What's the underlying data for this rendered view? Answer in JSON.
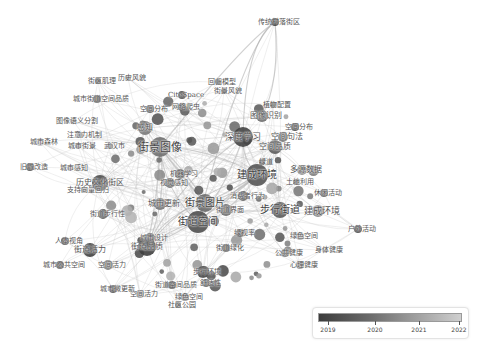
{
  "diagram": {
    "type": "keyword co-occurrence network overlay map",
    "nodes": [
      {
        "label": "街景图像",
        "x": 160,
        "y": 147,
        "r": 10,
        "shade": "#6f6f6f",
        "fs": 11
      },
      {
        "label": "街景图片",
        "x": 205,
        "y": 203,
        "r": 9,
        "shade": "#6a6a6a",
        "fs": 10
      },
      {
        "label": "街道空间",
        "x": 198,
        "y": 222,
        "r": 11,
        "shade": "#4f4f4f",
        "fs": 10
      },
      {
        "label": "建成环境",
        "x": 257,
        "y": 175,
        "r": 11,
        "shade": "#555555",
        "fs": 10
      },
      {
        "label": "步行街道",
        "x": 280,
        "y": 210,
        "r": 8,
        "shade": "#5a5a5a",
        "fs": 10
      },
      {
        "label": "城市更新",
        "x": 160,
        "y": 204,
        "r": 6,
        "shade": "#777777",
        "fs": 8
      },
      {
        "label": "历史文化街区",
        "x": 100,
        "y": 183,
        "r": 8,
        "shade": "#4b4b4b",
        "fs": 8
      },
      {
        "label": "深度学习",
        "x": 243,
        "y": 137,
        "r": 10,
        "shade": "#444444",
        "fs": 9
      },
      {
        "label": "空间品质",
        "x": 275,
        "y": 147,
        "r": 7,
        "shade": "#5c5c5c",
        "fs": 8
      },
      {
        "label": "图像识别",
        "x": 262,
        "y": 116,
        "r": 6,
        "shade": "#6a6a6a",
        "fs": 8
      },
      {
        "label": "空间句法",
        "x": 283,
        "y": 137,
        "r": 5,
        "shade": "#707070",
        "fs": 8
      },
      {
        "label": "多源数据",
        "x": 302,
        "y": 170,
        "r": 5,
        "shade": "#8c8c8c",
        "fs": 8
      },
      {
        "label": "街道品质",
        "x": 147,
        "y": 247,
        "r": 9,
        "shade": "#3f3f3f",
        "fs": 8
      },
      {
        "label": "感知",
        "x": 145,
        "y": 128,
        "r": 7,
        "shade": "#7a7a7a",
        "fs": 8
      },
      {
        "label": "建成环境",
        "x": 318,
        "y": 211,
        "r": 6,
        "shade": "#858585",
        "fs": 9
      },
      {
        "label": "传统村落街区",
        "x": 275,
        "y": 22,
        "r": 4,
        "shade": "#2f2f2f",
        "fs": 7
      },
      {
        "label": "历史风貌",
        "x": 128,
        "y": 78,
        "r": 3,
        "shade": "#909090",
        "fs": 7
      },
      {
        "label": "街区肌理",
        "x": 98,
        "y": 81,
        "r": 3,
        "shade": "#3b3b3b",
        "fs": 7
      },
      {
        "label": "城市街道空间品质",
        "x": 97,
        "y": 99,
        "r": 4,
        "shade": "#4d4d4d",
        "fs": 7
      },
      {
        "label": "空间分布",
        "x": 150,
        "y": 109,
        "r": 4,
        "shade": "#5a5a5a",
        "fs": 7
      },
      {
        "label": "CiteSpace",
        "x": 182,
        "y": 95,
        "r": 4,
        "shade": "#4a4a4a",
        "fs": 7
      },
      {
        "label": "网络爬虫",
        "x": 182,
        "y": 107,
        "r": 4,
        "shade": "#575757",
        "fs": 7
      },
      {
        "label": "回归模型",
        "x": 218,
        "y": 82,
        "r": 3,
        "shade": "#555555",
        "fs": 7
      },
      {
        "label": "街景风貌",
        "x": 224,
        "y": 91,
        "r": 3,
        "shade": "#6e6e6e",
        "fs": 7
      },
      {
        "label": "图像语义分割",
        "x": 73,
        "y": 121,
        "r": 3,
        "shade": "#a0a0a0",
        "fs": 7
      },
      {
        "label": "注意力机制",
        "x": 80,
        "y": 135,
        "r": 3,
        "shade": "#9a9a9a",
        "fs": 7
      },
      {
        "label": "城市森林",
        "x": 40,
        "y": 142,
        "r": 4,
        "shade": "#bcbcbc",
        "fs": 7
      },
      {
        "label": "城市街景",
        "x": 78,
        "y": 146,
        "r": 3,
        "shade": "#8a8a8a",
        "fs": 7
      },
      {
        "label": "武汉市",
        "x": 110,
        "y": 146,
        "r": 3,
        "shade": "#888888",
        "fs": 7
      },
      {
        "label": "城市感知",
        "x": 70,
        "y": 168,
        "r": 3,
        "shade": "#a8a8a8",
        "fs": 7
      },
      {
        "label": "旧城改造",
        "x": 30,
        "y": 167,
        "r": 4,
        "shade": "#333333",
        "fs": 7
      },
      {
        "label": "支持向量回归",
        "x": 84,
        "y": 190,
        "r": 3,
        "shade": "#9a9a9a",
        "fs": 7
      },
      {
        "label": "视觉感知",
        "x": 170,
        "y": 183,
        "r": 5,
        "shade": "#6a6a6a",
        "fs": 7
      },
      {
        "label": "机器学习",
        "x": 180,
        "y": 174,
        "r": 5,
        "shade": "#5f5f5f",
        "fs": 7
      },
      {
        "label": "植物配置",
        "x": 273,
        "y": 105,
        "r": 3,
        "shade": "#404040",
        "fs": 7
      },
      {
        "label": "空间分布",
        "x": 295,
        "y": 127,
        "r": 4,
        "shade": "#3b3b3b",
        "fs": 7
      },
      {
        "label": "绿道",
        "x": 262,
        "y": 162,
        "r": 3,
        "shade": "#4a4a4a",
        "fs": 7
      },
      {
        "label": "土地利用",
        "x": 296,
        "y": 182,
        "r": 3,
        "shade": "#5a5a5a",
        "fs": 7
      },
      {
        "label": "绿视率",
        "x": 240,
        "y": 233,
        "r": 4,
        "shade": "#5a5a5a",
        "fs": 7
      },
      {
        "label": "街道绿化",
        "x": 226,
        "y": 248,
        "r": 4,
        "shade": "#4a4a4a",
        "fs": 7
      },
      {
        "label": "绿色空间",
        "x": 300,
        "y": 236,
        "r": 4,
        "shade": "#a3a3a3",
        "fs": 7
      },
      {
        "label": "身体健康",
        "x": 325,
        "y": 250,
        "r": 3,
        "shade": "#b5b5b5",
        "fs": 7
      },
      {
        "label": "公共健康",
        "x": 285,
        "y": 253,
        "r": 4,
        "shade": "#777777",
        "fs": 7
      },
      {
        "label": "心理健康",
        "x": 300,
        "y": 265,
        "r": 4,
        "shade": "#858585",
        "fs": 7
      },
      {
        "label": "休闲活动",
        "x": 324,
        "y": 193,
        "r": 4,
        "shade": "#5b5b5b",
        "fs": 7
      },
      {
        "label": "户外活动",
        "x": 358,
        "y": 229,
        "r": 4,
        "shade": "#3f3f3f",
        "fs": 7
      },
      {
        "label": "城市设计",
        "x": 150,
        "y": 238,
        "r": 5,
        "shade": "#6c6c6c",
        "fs": 7
      },
      {
        "label": "城市公共空间",
        "x": 60,
        "y": 265,
        "r": 4,
        "shade": "#4e4e4e",
        "fs": 7
      },
      {
        "label": "人本视角",
        "x": 65,
        "y": 241,
        "r": 4,
        "shade": "#4a4a4a",
        "fs": 7
      },
      {
        "label": "街道活力",
        "x": 90,
        "y": 250,
        "r": 7,
        "shade": "#3f3f3f",
        "fs": 8
      },
      {
        "label": "空间活力",
        "x": 108,
        "y": 265,
        "r": 5,
        "shade": "#7a7a7a",
        "fs": 7
      },
      {
        "label": "街道步行性",
        "x": 103,
        "y": 214,
        "r": 5,
        "shade": "#505050",
        "fs": 7
      },
      {
        "label": "步行环境",
        "x": 203,
        "y": 272,
        "r": 6,
        "shade": "#4a4a4a",
        "fs": 7
      },
      {
        "label": "舒适性",
        "x": 206,
        "y": 283,
        "r": 4,
        "shade": "#5b5b5b",
        "fs": 7
      },
      {
        "label": "街道空间品质",
        "x": 172,
        "y": 285,
        "r": 4,
        "shade": "#3f3f3f",
        "fs": 7
      },
      {
        "label": "空间活力",
        "x": 140,
        "y": 294,
        "r": 4,
        "shade": "#9e9e9e",
        "fs": 7
      },
      {
        "label": "城市微更新",
        "x": 113,
        "y": 289,
        "r": 4,
        "shade": "#4f4f4f",
        "fs": 7
      },
      {
        "label": "绿色空间",
        "x": 185,
        "y": 297,
        "r": 4,
        "shade": "#7a7a7a",
        "fs": 7
      },
      {
        "label": "社区公园",
        "x": 178,
        "y": 305,
        "r": 3,
        "shade": "#555555",
        "fs": 7
      },
      {
        "label": "消费者行为",
        "x": 243,
        "y": 196,
        "r": 5,
        "shade": "#5d5d5d",
        "fs": 7
      },
      {
        "label": "街道界面",
        "x": 226,
        "y": 210,
        "r": 6,
        "shade": "#6c6c6c",
        "fs": 7
      }
    ],
    "legend": {
      "title": "",
      "ticks": [
        "2019",
        "2020",
        "2021",
        "2022"
      ],
      "tick_positions": [
        10,
        57,
        101,
        145
      ],
      "gradient_start": "#3c3c3c",
      "gradient_end": "#cfcfcf"
    }
  }
}
